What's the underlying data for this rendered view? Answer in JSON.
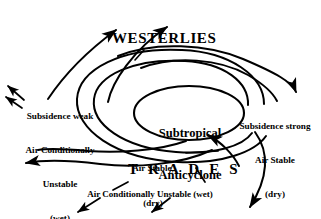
{
  "diagram": {
    "background_color": "#ffffff",
    "stroke_color": "#000000",
    "labels": {
      "westerlies": "WESTERLIES",
      "trades": "T R A D E S",
      "center_line1": "Subtropical",
      "center_line2": "Anticyclone",
      "left_line1": "Subsidence weak",
      "left_line2": "Air Conditionally",
      "left_line3": "Unstable",
      "left_line4": "(wet)",
      "right_line1": "Subsidence strong",
      "right_line2": "Air Stable",
      "right_line3": "(dry)",
      "mid_line1": "Air Stable,",
      "mid_line2": "(dry)",
      "bottom_caption": "Air Conditionally Unstable (wet)"
    },
    "icons": {
      "arrow_up_left_outflow": "arrow-icon",
      "arrow_up_right_westerlies": "arrow-icon",
      "arrow_down_right_subsidence": "arrow-icon",
      "arrow_left_trades": "arrow-icon",
      "arrow_down_bottom_right": "arrow-icon",
      "arrow_down_left_bottom": "arrow-icon",
      "spiral_anticyclone": "spiral-icon",
      "ellipse_center": "ellipse-icon"
    }
  }
}
